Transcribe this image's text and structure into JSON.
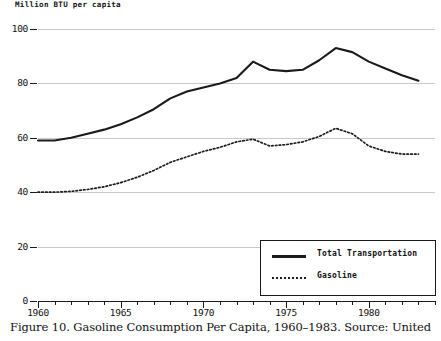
{
  "chart_data": {
    "type": "line",
    "title": "",
    "caption": "Figure 10. Gasoline Consumption Per Capita, 1960–1983. Source: United",
    "ylabel": "Million BTU per capita",
    "xlabel": "",
    "ylim": [
      0,
      100
    ],
    "xlim": [
      1960,
      1984
    ],
    "yticks": [
      0,
      20,
      40,
      60,
      80,
      100
    ],
    "ytick_labels": [
      "0",
      "20",
      "40",
      "60",
      "80",
      "100"
    ],
    "xticks": [
      1960,
      1965,
      1970,
      1975,
      1980
    ],
    "xtick_labels": [
      "1960",
      "1965",
      "1970",
      "1975",
      "1980"
    ],
    "minor_xticks_every": 1,
    "grid": "horizontal",
    "legend_position": "bottom-right",
    "x": [
      1960,
      1961,
      1962,
      1963,
      1964,
      1965,
      1966,
      1967,
      1968,
      1969,
      1970,
      1971,
      1972,
      1973,
      1974,
      1975,
      1976,
      1977,
      1978,
      1979,
      1980,
      1981,
      1982,
      1983
    ],
    "series": [
      {
        "name": "Total Transportation",
        "style": "solid",
        "color": "#1a1a1a",
        "values": [
          59,
          59,
          60,
          61.5,
          63,
          65,
          67.5,
          70.5,
          74.5,
          77,
          78.5,
          80,
          82,
          88,
          85,
          84.5,
          85,
          88.5,
          93,
          91.5,
          88,
          85.5,
          83,
          81
        ]
      },
      {
        "name": "Gasoline",
        "style": "dotted",
        "color": "#1a1a1a",
        "values": [
          40,
          40,
          40.3,
          41,
          42,
          43.5,
          45.5,
          48,
          51,
          53,
          55,
          56.5,
          58.5,
          59.5,
          57,
          57.5,
          58.5,
          60.5,
          63.5,
          61.5,
          57,
          55,
          54,
          54
        ]
      }
    ]
  },
  "legend": {
    "items": [
      {
        "label": "Total Transportation",
        "style": "solid"
      },
      {
        "label": "Gasoline",
        "style": "dotted"
      }
    ]
  }
}
